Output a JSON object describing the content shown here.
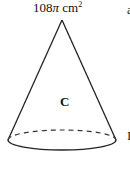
{
  "figure": {
    "area_value": "108",
    "area_symbol": "π",
    "area_unit": " cm",
    "area_exponent": "2",
    "shape_label": "C",
    "shape": "cone",
    "edge_fragments": [
      "a",
      "I"
    ]
  }
}
